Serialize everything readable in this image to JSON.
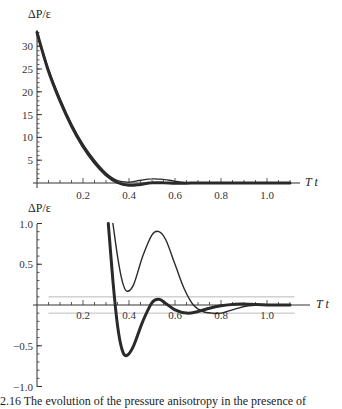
{
  "chart_data": [
    {
      "type": "line",
      "title": "",
      "ylabel": "ΔP/ε",
      "xlabel": "T t",
      "xlim": [
        0,
        1.12
      ],
      "ylim": [
        0,
        33
      ],
      "x_ticks": [
        0.2,
        0.4,
        0.6,
        0.8,
        1.0
      ],
      "x_tick_labels": [
        "0.2",
        "0.4",
        "0.6",
        "0.8",
        "1.0"
      ],
      "y_ticks": [
        5,
        10,
        15,
        20,
        25,
        30
      ],
      "y_tick_labels": [
        "5",
        "10",
        "15",
        "20",
        "25",
        "30"
      ],
      "grid": false,
      "series": [
        {
          "name": "thin curve",
          "x": [
            0,
            0.05,
            0.1,
            0.15,
            0.2,
            0.25,
            0.3,
            0.35,
            0.4,
            0.45,
            0.5,
            0.55,
            0.6,
            0.65,
            0.7,
            0.8,
            0.9,
            1.0,
            1.1
          ],
          "values": [
            33,
            25,
            18.5,
            13,
            8.5,
            5,
            2.2,
            0.5,
            0.2,
            0.6,
            0.9,
            0.8,
            0.4,
            0.05,
            0,
            0,
            0,
            0,
            0
          ]
        },
        {
          "name": "thick curve",
          "x": [
            0,
            0.05,
            0.1,
            0.15,
            0.2,
            0.25,
            0.3,
            0.35,
            0.4,
            0.45,
            0.5,
            0.55,
            0.6,
            0.65,
            0.7,
            0.8,
            0.9,
            1.0,
            1.1
          ],
          "values": [
            33,
            24.5,
            18,
            12.5,
            8,
            4.5,
            1.8,
            0.1,
            -0.5,
            -0.3,
            0.05,
            0.05,
            -0.05,
            -0.05,
            0,
            0,
            0,
            0,
            0
          ]
        }
      ]
    },
    {
      "type": "line",
      "title": "",
      "ylabel": "ΔP/ε",
      "xlabel": "T t",
      "xlim": [
        0,
        1.12
      ],
      "ylim": [
        -1.0,
        1.0
      ],
      "x_ticks": [
        0.2,
        0.4,
        0.6,
        0.8,
        1.0
      ],
      "x_tick_labels": [
        "0.2",
        "0.4",
        "0.6",
        "0.8",
        "1.0"
      ],
      "y_ticks": [
        -1.0,
        -0.5,
        0.5,
        1.0
      ],
      "y_tick_labels": [
        "−1.0",
        "−0.5",
        "0.5",
        "1.0"
      ],
      "reference_lines": [
        0.1,
        -0.1
      ],
      "grid": false,
      "series": [
        {
          "name": "thin curve",
          "x": [
            0.33,
            0.35,
            0.37,
            0.39,
            0.42,
            0.46,
            0.5,
            0.53,
            0.56,
            0.6,
            0.64,
            0.68,
            0.72,
            0.76,
            0.8,
            0.86,
            0.92,
            1.0,
            1.1
          ],
          "values": [
            1.0,
            0.6,
            0.3,
            0.17,
            0.25,
            0.6,
            0.86,
            0.9,
            0.8,
            0.5,
            0.2,
            0.0,
            -0.08,
            -0.1,
            -0.1,
            -0.05,
            -0.01,
            0.0,
            0.0
          ]
        },
        {
          "name": "thick curve",
          "x": [
            0.31,
            0.33,
            0.35,
            0.37,
            0.39,
            0.42,
            0.46,
            0.5,
            0.53,
            0.56,
            0.6,
            0.65,
            0.7,
            0.75,
            0.8,
            0.86,
            0.92,
            1.0,
            1.1
          ],
          "values": [
            1.0,
            0.3,
            -0.25,
            -0.55,
            -0.62,
            -0.5,
            -0.2,
            0.03,
            0.07,
            0.02,
            -0.06,
            -0.1,
            -0.08,
            -0.04,
            -0.01,
            0.01,
            0.01,
            0.0,
            0.0
          ]
        }
      ]
    }
  ],
  "figure": {
    "top_ylabel": "ΔP/ε",
    "bottom_ylabel": "ΔP/ε",
    "xlabel": "T t",
    "caption_fragment": "2.16 The evolution of the pressure anisotropy in the presence of"
  }
}
